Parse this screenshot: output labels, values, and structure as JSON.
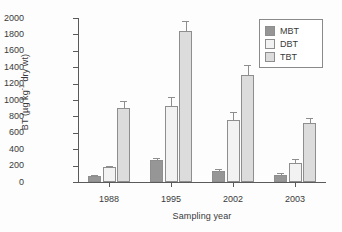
{
  "chart_data": {
    "type": "bar",
    "title": "",
    "xlabel": "Sampling year",
    "ylabel": "BT (µg kg⁻¹ dry wt)",
    "ylabel_parts": {
      "prefix": "BT (µg kg",
      "sup": "-1",
      "suffix": " dry wt)"
    },
    "categories": [
      "1988",
      "1995",
      "2002",
      "2003"
    ],
    "ylim": [
      0,
      2000
    ],
    "yticks": [
      0,
      200,
      400,
      600,
      800,
      1000,
      1200,
      1400,
      1600,
      1800,
      2000
    ],
    "ytick_labels": [
      "0",
      "200",
      "400",
      "600",
      "800",
      "1000",
      "1200",
      "1400",
      "1600",
      "1800",
      "2000"
    ],
    "grid": false,
    "legend_position": "top-right",
    "series": [
      {
        "name": "MBT",
        "color": "#969696",
        "values": [
          75,
          270,
          140,
          90
        ],
        "errors": [
          15,
          20,
          15,
          15
        ]
      },
      {
        "name": "DBT",
        "color": "#f2f2f2",
        "values": [
          180,
          930,
          760,
          230
        ],
        "errors": [
          20,
          110,
          95,
          45
        ]
      },
      {
        "name": "TBT",
        "color": "#dcdcdc",
        "values": [
          900,
          1840,
          1310,
          720
        ],
        "errors": [
          85,
          120,
          115,
          60
        ]
      }
    ]
  },
  "legend": {
    "items": [
      {
        "label": "MBT",
        "color": "#969696"
      },
      {
        "label": "DBT",
        "color": "#f2f2f2"
      },
      {
        "label": "TBT",
        "color": "#dcdcdc"
      }
    ]
  }
}
